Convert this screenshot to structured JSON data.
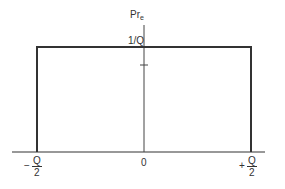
{
  "diagram": {
    "y_axis_label": {
      "main": "Pr",
      "subscript": "e"
    },
    "level_label": "1/Q",
    "x_ticks": {
      "left": {
        "sign": "−",
        "numerator": "Q",
        "denominator": "2"
      },
      "center": "0",
      "right": {
        "sign": "+",
        "numerator": "Q",
        "denominator": "2"
      }
    },
    "colors": {
      "line": "#333333",
      "text": "#333333",
      "background": "#ffffff"
    }
  }
}
